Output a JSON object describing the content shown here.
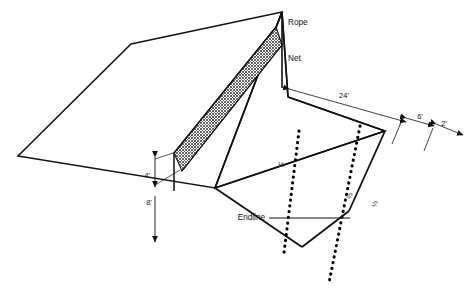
{
  "diagram": {
    "labels": {
      "rope": "Rope",
      "net": "Net",
      "endline": "Endline"
    },
    "dimensions": [
      {
        "name": "court-width-24",
        "value": "24'"
      },
      {
        "name": "zone-6",
        "value": "6'"
      },
      {
        "name": "zone-2",
        "value": "2'"
      },
      {
        "name": "net-height-4",
        "value": "4'"
      },
      {
        "name": "pole-height-8",
        "value": "8'"
      }
    ],
    "fractions": [
      {
        "name": "court-half",
        "value": "½"
      },
      {
        "name": "zone-two-thirds",
        "value": "⅔"
      },
      {
        "name": "zone-one-third",
        "value": "⅓"
      }
    ],
    "colors": {
      "line": "#111111",
      "net_fill": "#9a9a9a",
      "background": "#ffffff",
      "dotted": "#000000"
    }
  }
}
